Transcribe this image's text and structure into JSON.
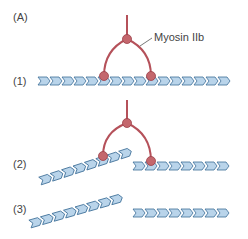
{
  "figure": {
    "panel_label": "(A)",
    "protein_label": "Myosin IIb",
    "steps": [
      {
        "label": "(1)",
        "description": "myosin IIb bound to a single actin filament"
      },
      {
        "label": "(2)",
        "description": "myosin IIb straddling two filaments, one tilted"
      },
      {
        "label": "(3)",
        "description": "two separated actin filaments"
      }
    ]
  },
  "colors": {
    "myosin": "#b5515a",
    "myosin_node": "#c4676d",
    "actin_fill": "#b9d4ea",
    "actin_stroke": "#3e6f98",
    "text": "#444444"
  }
}
